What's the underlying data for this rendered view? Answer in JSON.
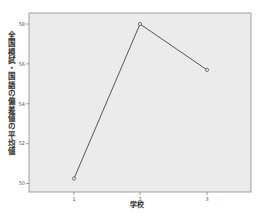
{
  "chart_data": {
    "type": "line",
    "title": "",
    "xlabel": "学校",
    "ylabel": "全国模試・国語の偏差値の平均値",
    "categories": [
      "1",
      "2",
      "3"
    ],
    "series": [
      {
        "name": "全国模試・国語の偏差値の平均値",
        "values": [
          50.25,
          58.0,
          55.7
        ]
      }
    ],
    "yticks": [
      "50",
      "52",
      "54",
      "56",
      "58"
    ],
    "ylim": [
      49.6,
      58.5
    ],
    "grid": false,
    "legend": "none",
    "colors": {
      "background": "#ebebeb",
      "line": "#555555",
      "axis": "#777777"
    }
  }
}
